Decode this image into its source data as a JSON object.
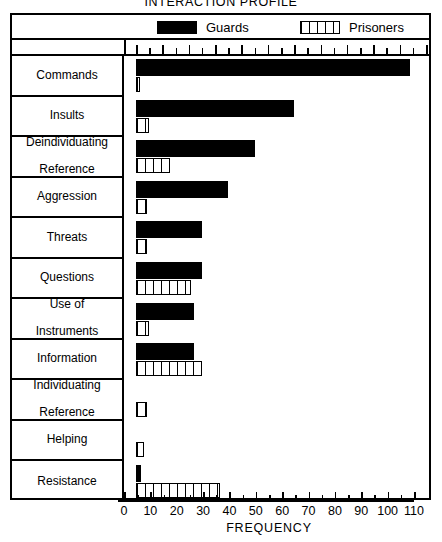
{
  "title": "INTERACTION PROFILE",
  "legend": {
    "guards": {
      "label": "Guards",
      "swatch": "solid-black-box",
      "color": "#000000"
    },
    "prisoners": {
      "label": "Prisoners",
      "swatch": "vertical-hatched-box",
      "color": "#ffffff"
    }
  },
  "axis": {
    "xlabel": "FREQUENCY",
    "ticks": [
      "0",
      "10",
      "20",
      "30",
      "40",
      "50",
      "60",
      "70",
      "80",
      "90",
      "100",
      "110"
    ]
  },
  "chart_data": {
    "type": "bar",
    "orientation": "horizontal",
    "title": "INTERACTION PROFILE",
    "xlabel": "FREQUENCY",
    "ylabel": "",
    "xlim": [
      0,
      110
    ],
    "xticks": [
      0,
      10,
      20,
      30,
      40,
      50,
      60,
      70,
      80,
      90,
      100,
      110
    ],
    "minor_tick_step": 5,
    "grid": false,
    "legend_position": "top",
    "categories": [
      "Commands",
      "Insults",
      "Deindividuating Reference",
      "Aggression",
      "Threats",
      "Questions",
      "Use of Instruments",
      "Information",
      "Individuating Reference",
      "Helping",
      "Resistance"
    ],
    "category_lines": [
      [
        "Commands"
      ],
      [
        "Insults"
      ],
      [
        "Deindividuating",
        "Reference"
      ],
      [
        "Aggression"
      ],
      [
        "Threats"
      ],
      [
        "Questions"
      ],
      [
        "Use of",
        "Instruments"
      ],
      [
        "Information"
      ],
      [
        "Individuating",
        "Reference"
      ],
      [
        "Helping"
      ],
      [
        "Resistance"
      ]
    ],
    "series": [
      {
        "name": "Guards",
        "values": [
          104,
          60,
          45,
          35,
          25,
          25,
          22,
          22,
          0,
          0,
          2
        ]
      },
      {
        "name": "Prisoners",
        "values": [
          1,
          5,
          13,
          4,
          4,
          21,
          5,
          25,
          4,
          3,
          32
        ]
      }
    ]
  }
}
